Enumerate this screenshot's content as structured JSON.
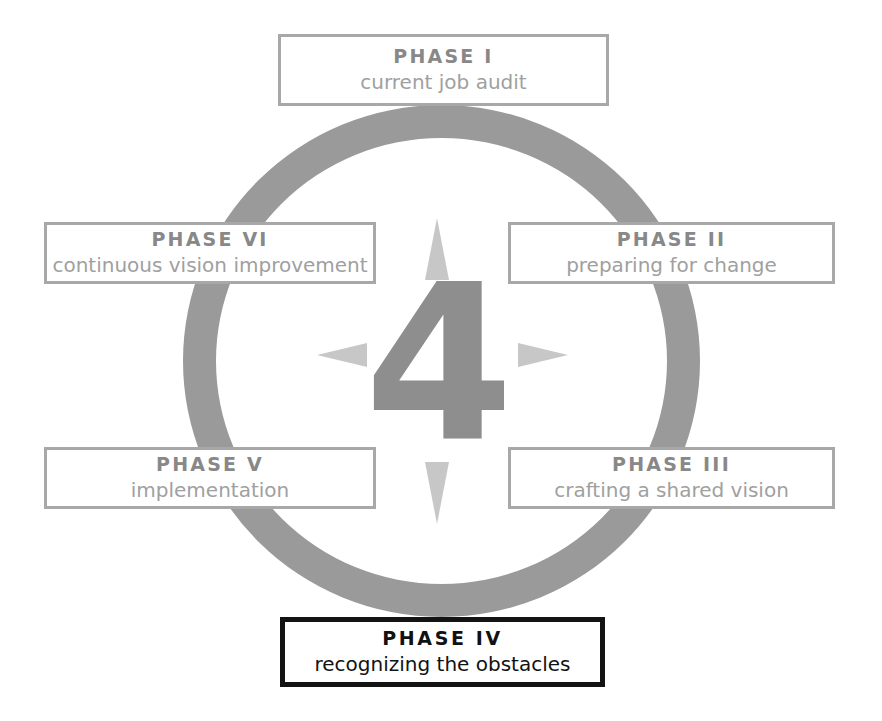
{
  "diagram": {
    "center_numeral": "4",
    "ring_color": "#9a9a9a",
    "arrow_color": "#c7c7c7",
    "box_border_color": "#a8a8a8",
    "highlight_border_color": "#131313",
    "arrows": [
      {
        "name": "arrow-up-icon",
        "direction": "up"
      },
      {
        "name": "arrow-right-icon",
        "direction": "right"
      },
      {
        "name": "arrow-down-icon",
        "direction": "down"
      },
      {
        "name": "arrow-left-icon",
        "direction": "left"
      }
    ],
    "phases": [
      {
        "id": "phase-1",
        "title": "PHASE I",
        "subtitle": "current job audit",
        "position": "top",
        "highlighted": false
      },
      {
        "id": "phase-2",
        "title": "PHASE II",
        "subtitle": "preparing for change",
        "position": "right-upper",
        "highlighted": false
      },
      {
        "id": "phase-3",
        "title": "PHASE III",
        "subtitle": "crafting a shared vision",
        "position": "right-lower",
        "highlighted": false
      },
      {
        "id": "phase-4",
        "title": "PHASE  IV",
        "subtitle": "recognizing the obstacles",
        "position": "bottom",
        "highlighted": true
      },
      {
        "id": "phase-5",
        "title": "PHASE  V",
        "subtitle": "implementation",
        "position": "left-lower",
        "highlighted": false
      },
      {
        "id": "phase-6",
        "title": "PHASE VI",
        "subtitle": "continuous vision improvement",
        "position": "left-upper",
        "highlighted": false
      }
    ]
  }
}
